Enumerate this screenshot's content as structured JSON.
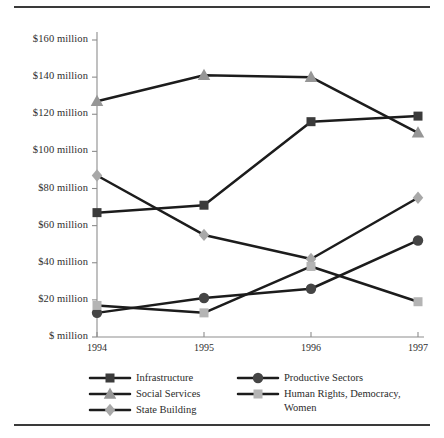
{
  "chart_data": {
    "type": "line",
    "title": "",
    "subtitle": "",
    "xlabel": "",
    "ylabel": "",
    "x": [
      "1994",
      "1995",
      "1996",
      "1997"
    ],
    "categories": [
      "1994",
      "1995",
      "1996",
      "1997"
    ],
    "ylim": [
      0,
      160
    ],
    "ytick_values": [
      0,
      20,
      40,
      60,
      80,
      100,
      120,
      140,
      160
    ],
    "ytick_labels": [
      "$ million",
      "$20 million",
      "$40 million",
      "$60 million",
      "$80 million",
      "$100 million",
      "$120 million",
      "$140 million",
      "$160 million"
    ],
    "xtick_labels": [
      "1994",
      "1995",
      "1996",
      "1997"
    ],
    "grid": false,
    "legend_position": "bottom",
    "series": [
      {
        "name": "Infrastructure",
        "marker": "square",
        "color": "#3b3b3b",
        "line_color": "#1c1c1c",
        "values": [
          67,
          71,
          116,
          119
        ]
      },
      {
        "name": "Social Services",
        "marker": "triangle",
        "color": "#969696",
        "line_color": "#1c1c1c",
        "values": [
          127,
          141,
          140,
          110
        ]
      },
      {
        "name": "State Building",
        "marker": "diamond",
        "color": "#a8a8a8",
        "line_color": "#1c1c1c",
        "values": [
          87,
          55,
          42,
          75
        ]
      },
      {
        "name": "Productive Sectors",
        "marker": "circle",
        "color": "#454545",
        "line_color": "#1c1c1c",
        "values": [
          13,
          21,
          26,
          52
        ]
      },
      {
        "name": "Human Rights, Democracy, Women",
        "marker": "square",
        "color": "#b4b4b4",
        "line_color": "#1c1c1c",
        "values": [
          17,
          13,
          38,
          19
        ]
      }
    ]
  },
  "legend": {
    "entries": [
      {
        "label": "Infrastructure",
        "label2": ""
      },
      {
        "label": "Social Services",
        "label2": ""
      },
      {
        "label": "State Building",
        "label2": ""
      },
      {
        "label": "Productive Sectors",
        "label2": ""
      },
      {
        "label": "Human Rights, Democracy,",
        "label2": "Women"
      }
    ]
  },
  "axis": {
    "y_labels": [
      "$160 million",
      "$140 million",
      "$120 million",
      "$100 million",
      "$80 million",
      "$60 million",
      "$40 million",
      "$20 million",
      "$ million"
    ],
    "x_labels": [
      "1994",
      "1995",
      "1996",
      "1997"
    ]
  },
  "colors": {
    "axis": "#8d8d8d",
    "line": "#1c1c1c",
    "rule": "#3a3a3a",
    "text": "#2a2a2a"
  }
}
